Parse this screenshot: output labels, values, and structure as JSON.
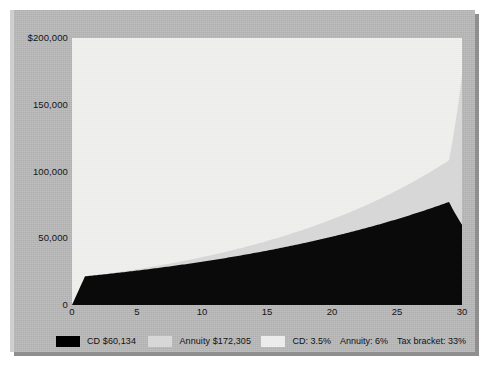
{
  "chart_data": {
    "type": "area",
    "title": "",
    "xlabel": "",
    "ylabel": "",
    "xlim": [
      0,
      30
    ],
    "ylim": [
      0,
      200000
    ],
    "grid": false,
    "legend_position": "bottom",
    "x_ticks": [
      "0",
      "5",
      "10",
      "15",
      "20",
      "25",
      "30"
    ],
    "x_tick_values": [
      0,
      5,
      10,
      15,
      20,
      25,
      30
    ],
    "y_ticks": [
      "0",
      "50,000",
      "100,000",
      "150,000",
      "$200,000"
    ],
    "y_tick_values": [
      0,
      50000,
      100000,
      150000,
      200000
    ],
    "x": [
      0,
      1,
      2,
      3,
      4,
      5,
      6,
      7,
      8,
      9,
      10,
      11,
      12,
      13,
      14,
      15,
      16,
      17,
      18,
      19,
      20,
      21,
      22,
      23,
      24,
      25,
      26,
      27,
      28,
      29,
      30
    ],
    "series": [
      {
        "name": "Annuity",
        "color": "#d7d7d7",
        "final_value": 172305,
        "values": [
          0,
          21200,
          22472,
          23820,
          25250,
          26765,
          28370,
          30073,
          31877,
          33790,
          35818,
          37967,
          40245,
          42660,
          45219,
          47933,
          50809,
          53857,
          57089,
          60514,
          64145,
          67994,
          72073,
          76398,
          80982,
          85841,
          90991,
          96451,
          102238,
          108372,
          172305
        ]
      },
      {
        "name": "CD",
        "color": "#0a0a0a",
        "final_value": 60134,
        "values": [
          0,
          21469,
          22473,
          23524,
          24624,
          25776,
          26981,
          28243,
          29564,
          30947,
          32394,
          33909,
          35495,
          37155,
          38893,
          40712,
          42616,
          44609,
          46696,
          48880,
          51166,
          53559,
          56064,
          58686,
          61431,
          64304,
          67311,
          70459,
          73755,
          77205,
          60134
        ]
      }
    ]
  },
  "axis": {
    "y_labels": [
      {
        "text": "$200,000",
        "value": 200000
      },
      {
        "text": "150,000",
        "value": 150000
      },
      {
        "text": "100,000",
        "value": 100000
      },
      {
        "text": "50,000",
        "value": 50000
      },
      {
        "text": "0",
        "value": 0
      }
    ],
    "x_labels": [
      {
        "text": "0",
        "value": 0
      },
      {
        "text": "5",
        "value": 5
      },
      {
        "text": "10",
        "value": 10
      },
      {
        "text": "15",
        "value": 15
      },
      {
        "text": "20",
        "value": 20
      },
      {
        "text": "25",
        "value": 25
      },
      {
        "text": "30",
        "value": 30
      }
    ]
  },
  "legend": {
    "cd_label": "CD $60,134",
    "annuity_label": "Annuity $172,305",
    "assumption_cd": "CD: 3.5%",
    "assumption_annuity": "Annuity: 6%",
    "assumption_tax": "Tax bracket: 33%"
  },
  "colors": {
    "cd_fill": "#0a0a0a",
    "annuity_fill": "#d7d7d7",
    "plot_background": "#efefee",
    "panel_background": "#b9b9b9",
    "page_background": "#ffffff"
  }
}
